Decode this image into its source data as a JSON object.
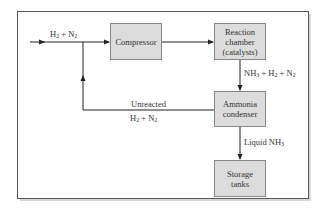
{
  "diagram": {
    "title": "",
    "nodes": [
      {
        "id": "compressor",
        "label": "Compressor"
      },
      {
        "id": "reaction_chamber",
        "label": "Reaction\nchamber\n(catalysts)"
      },
      {
        "id": "ammonia_condenser",
        "label": "Ammonia\ncondenser"
      },
      {
        "id": "storage_tanks",
        "label": "Storage\ntanks"
      }
    ],
    "edges": [
      {
        "from": "input",
        "to": "compressor",
        "label": "H2 + N2"
      },
      {
        "from": "compressor",
        "to": "reaction_chamber",
        "label": ""
      },
      {
        "from": "reaction_chamber",
        "to": "ammonia_condenser",
        "label": "NH3 + H2 + N2"
      },
      {
        "from": "ammonia_condenser",
        "to": "input_junction",
        "label": "Unreacted H2 + N2"
      },
      {
        "from": "ammonia_condenser",
        "to": "storage_tanks",
        "label": "Liquid NH3"
      }
    ],
    "labels": {
      "feed": {
        "a": "H",
        "a_sub": "2",
        "plus": " + N",
        "b_sub": "2"
      },
      "nh3_mix": {
        "t1": "NH",
        "s1": "3",
        "t2": " + H",
        "s2": "2",
        "t3": " + N",
        "s3": "2"
      },
      "unreacted_line1": "Unreacted",
      "unreacted_line2": {
        "t1": "H",
        "s1": "2",
        "t2": " + N",
        "s2": "2"
      },
      "liquid": {
        "t1": "Liquid NH",
        "s1": "3"
      }
    }
  },
  "colors": {
    "box_fill": "#dcdcdc",
    "box_border": "#888888",
    "line": "#222222",
    "frame": "#555555"
  }
}
